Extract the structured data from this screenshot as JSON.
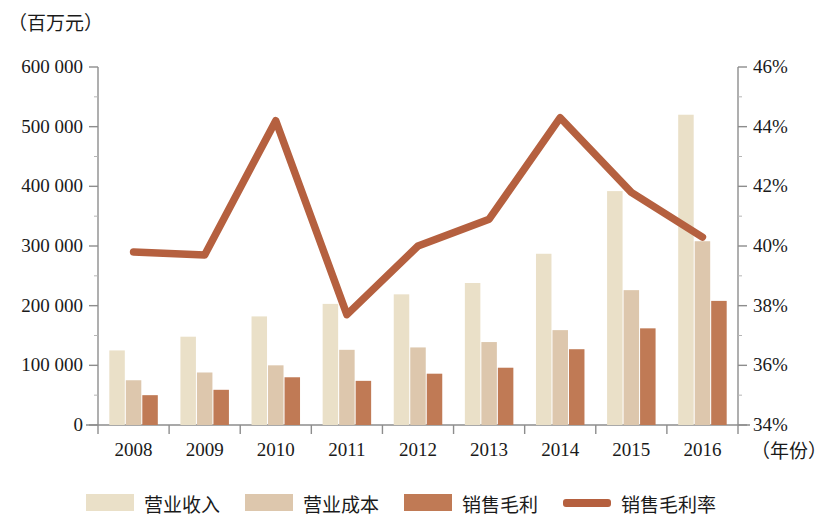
{
  "axes": {
    "unit_label": "（百万元）",
    "x_axis_label": "（年份）",
    "left_ticks": [
      "0",
      "100 000",
      "200 000",
      "300 000",
      "400 000",
      "500 000",
      "600 000"
    ],
    "right_ticks": [
      "34%",
      "36%",
      "38%",
      "40%",
      "42%",
      "44%",
      "46%"
    ]
  },
  "legend": {
    "items": [
      {
        "label": "营业收入",
        "color": "#eae0c8",
        "marker": "swatch"
      },
      {
        "label": "营业成本",
        "color": "#ddc7ad",
        "marker": "swatch"
      },
      {
        "label": "销售毛利",
        "color": "#c07a55",
        "marker": "swatch"
      },
      {
        "label": "销售毛利率",
        "color": "#b5603f",
        "marker": "line"
      }
    ]
  },
  "chart_data": {
    "type": "bar",
    "title": "",
    "xlabel": "（年份）",
    "ylabel": "（百万元）",
    "categories": [
      "2008",
      "2009",
      "2010",
      "2011",
      "2012",
      "2013",
      "2014",
      "2015",
      "2016"
    ],
    "ylim": [
      0,
      600000
    ],
    "y2lim": [
      34,
      46
    ],
    "grid": false,
    "legend_position": "bottom",
    "series": [
      {
        "name": "营业收入",
        "type": "bar",
        "axis": "left",
        "color": "#eae0c8",
        "values": [
          125000,
          148000,
          182000,
          203000,
          219000,
          238000,
          287000,
          392000,
          520000
        ]
      },
      {
        "name": "营业成本",
        "type": "bar",
        "axis": "left",
        "color": "#ddc7ad",
        "values": [
          75000,
          88000,
          100000,
          126000,
          130000,
          139000,
          159000,
          226000,
          308000
        ]
      },
      {
        "name": "销售毛利",
        "type": "bar",
        "axis": "left",
        "color": "#c07a55",
        "values": [
          50000,
          59000,
          80000,
          74000,
          86000,
          96000,
          127000,
          162000,
          208000
        ]
      },
      {
        "name": "销售毛利率",
        "type": "line",
        "axis": "right",
        "color": "#b5603f",
        "values": [
          39.8,
          39.7,
          44.2,
          37.7,
          40.0,
          40.9,
          44.3,
          41.8,
          40.3
        ]
      }
    ]
  }
}
